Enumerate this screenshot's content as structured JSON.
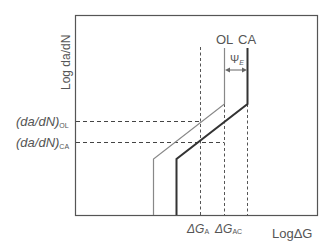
{
  "diagram": {
    "type": "fatigue crack growth schematic",
    "y_axis_label": "Log da/dN",
    "x_axis_label": "LogΔG",
    "curves": [
      {
        "name": "OL",
        "label": "OL",
        "style": "thin",
        "color": "#888888"
      },
      {
        "name": "CA",
        "label": "CA",
        "style": "thick",
        "color": "#333333"
      }
    ],
    "shift_label": "Ψ",
    "shift_subscript": "E",
    "y_markers": [
      {
        "label": "(da/dN)",
        "subscript": "OL"
      },
      {
        "label": "(da/dN)",
        "subscript": "CA"
      }
    ],
    "x_markers": [
      {
        "label": "ΔG",
        "subscript": "A"
      },
      {
        "label": "ΔG",
        "subscript": "AC"
      }
    ]
  }
}
